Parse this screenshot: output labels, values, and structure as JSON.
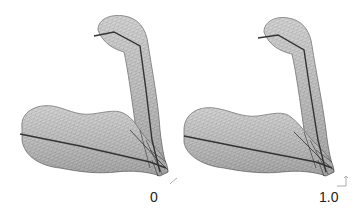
{
  "figure": {
    "panels": [
      {
        "label": "0",
        "axis_icon": "coordinate-axes-icon"
      },
      {
        "label": "1.0",
        "axis_icon": "coordinate-axes-icon"
      }
    ]
  },
  "colors": {
    "background": "#ffffff",
    "mesh_fill": "#c9c9c9",
    "mesh_line": "#8a8a8a",
    "mesh_outline": "#6f6f6f",
    "action_line": "#333333",
    "label_text": "#222222"
  }
}
